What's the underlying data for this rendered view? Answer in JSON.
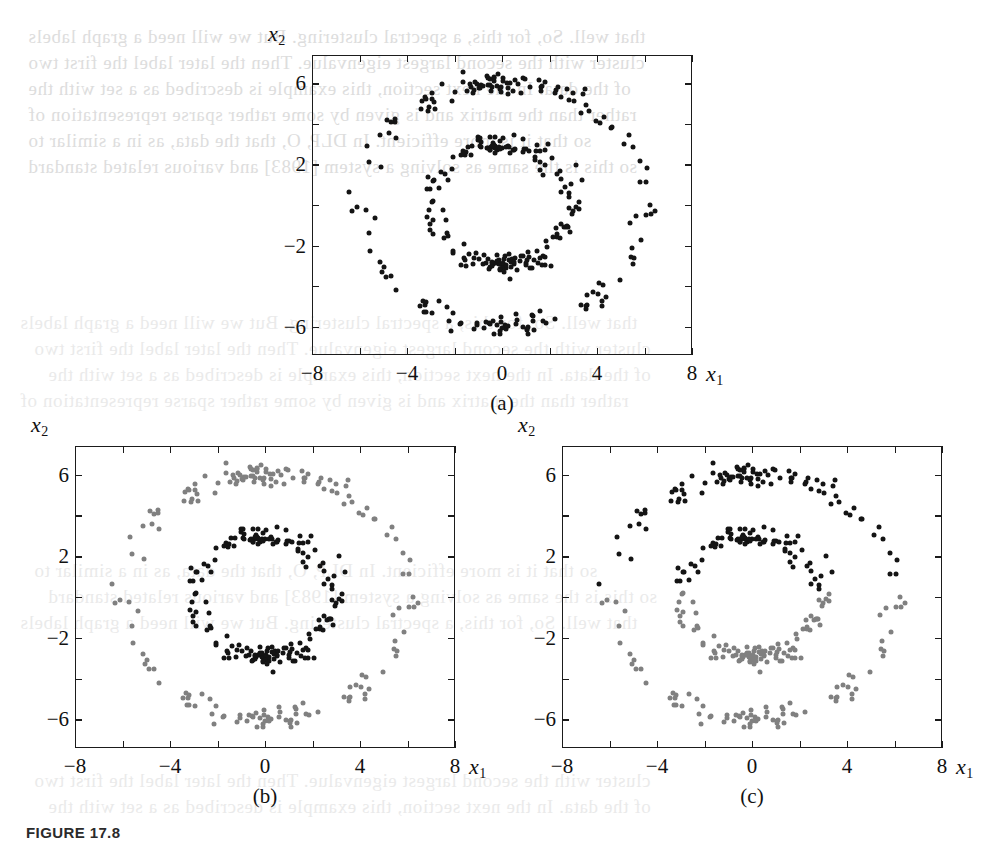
{
  "figure": {
    "caption": "FIGURE 17.8",
    "background_bleed": [
      "that well. So, for this, a spectral clustering. But we will need a graph labels",
      "cluster with the second largest eigenvalue. Then the later label the first two",
      "of the data. In the next section, this example is described as a set with the",
      "rather than the matrix and is given by some rather sparse representation of",
      "so that it is more efficient. In DLP, O, that the data, as in a similar to",
      "so this is the same as solving a system [1983] and various related standard"
    ]
  },
  "axes": {
    "x_title": "x",
    "x_sub": "1",
    "y_title": "x",
    "y_sub": "2",
    "x_ticklabels": [
      "-8",
      "-4",
      "0",
      "4",
      "8"
    ],
    "x_tickvalues": [
      -8,
      -4,
      0,
      4,
      8
    ],
    "y_ticklabels": [
      "6",
      "2",
      "-2",
      "-6"
    ],
    "y_tickvalues": [
      6,
      2,
      -2,
      -6
    ],
    "minor_tick_step": 2,
    "xlim": [
      -8,
      8
    ],
    "ylim": [
      -7.4,
      7.4
    ]
  },
  "colors": {
    "cluster_black": "#141414",
    "cluster_gray": "#808080",
    "axis": "#1b1b1b",
    "background": "#ffffff"
  },
  "panels": [
    {
      "id": "a",
      "tag": "(a)",
      "description": "unlabelled data: two concentric rings, all points black"
    },
    {
      "id": "b",
      "tag": "(b)",
      "description": "correct clustering: outer ring gray, inner ring black"
    },
    {
      "id": "c",
      "tag": "(c)",
      "description": "incorrect clustering: split by a horizontal line, upper half black, lower half gray"
    }
  ],
  "chart_data": {
    "type": "scatter",
    "title": "",
    "xlabel": "x1",
    "ylabel": "x2",
    "xlim": [
      -8,
      8
    ],
    "ylim": [
      -7.4,
      7.4
    ],
    "grid": false,
    "legend": "none",
    "n_points_per_ring": 180,
    "rings": [
      {
        "name": "outer",
        "radius": 6.0,
        "radial_noise": 0.28,
        "n": 180
      },
      {
        "name": "inner",
        "radius": 3.0,
        "radial_noise": 0.28,
        "n": 180
      }
    ],
    "panel_colorings": {
      "a": {
        "rule": "all-black",
        "outer": "#141414",
        "inner": "#141414"
      },
      "b": {
        "rule": "by-ring",
        "outer": "#808080",
        "inner": "#141414"
      },
      "c": {
        "rule": "by-halfplane",
        "split_axis": "x2",
        "split_value": 0.3,
        "above": "#141414",
        "below": "#808080"
      }
    }
  }
}
